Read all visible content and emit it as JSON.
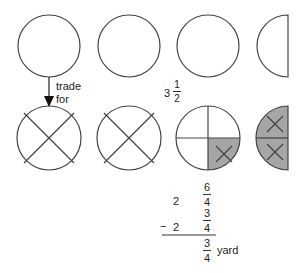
{
  "diagram": {
    "title": "",
    "colors": {
      "stroke": "#444444",
      "shaded": "#a6a6a6",
      "background": "#ffffff"
    },
    "top_row": {
      "shapes": [
        "whole circle",
        "whole circle",
        "whole circle",
        "half circle"
      ],
      "mixed_number": {
        "whole": "3",
        "numerator": "1",
        "denominator": "2"
      }
    },
    "arrow": {
      "label_line1": "trade",
      "label_line2": "for"
    },
    "bottom_row": {
      "shapes": [
        "circle divided into 4 quarters, all crossed out",
        "circle divided into 4 quarters, all crossed out",
        "circle divided into 4 quarters, 1 shaded and crossed",
        "half circle in 2 quarters, both shaded and crossed"
      ]
    },
    "subtraction": {
      "row1": {
        "whole": "2",
        "numerator": "6",
        "denominator": "4"
      },
      "row2": {
        "operator": "−",
        "whole": "2",
        "numerator": "3",
        "denominator": "4"
      },
      "result": {
        "numerator": "3",
        "denominator": "4",
        "unit": "yard"
      }
    }
  }
}
